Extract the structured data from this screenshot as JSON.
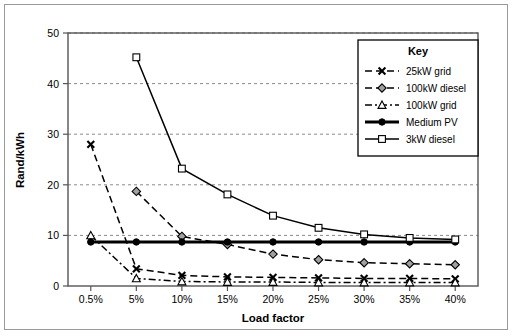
{
  "chart_data": {
    "type": "line",
    "title": "",
    "xlabel": "Load factor",
    "ylabel": "Rand/kWh",
    "categories": [
      "0.5%",
      "5%",
      "10%",
      "15%",
      "20%",
      "25%",
      "30%",
      "35%",
      "40%"
    ],
    "ylim": [
      0,
      50
    ],
    "yticks": [
      0,
      10,
      20,
      30,
      40,
      50
    ],
    "ytick_labels": [
      "0",
      "10",
      "20",
      "30",
      "40",
      "50"
    ],
    "grid": "horizontal-dashed",
    "legend_position": "upper-right-inside",
    "legend_title": "Key",
    "series": [
      {
        "name": "25kW grid",
        "marker": "x",
        "line": "dashed",
        "color": "#000000",
        "values": [
          28.0,
          3.4,
          2.1,
          1.8,
          1.7,
          1.6,
          1.5,
          1.5,
          1.4
        ]
      },
      {
        "name": "100kW diesel",
        "marker": "diamond-filled-gray",
        "line": "dashed",
        "color": "#000000",
        "marker_fill": "#a0a0a0",
        "values": [
          null,
          18.7,
          9.8,
          8.2,
          6.3,
          5.2,
          4.6,
          4.4,
          4.2
        ]
      },
      {
        "name": "100kW grid",
        "marker": "triangle-open",
        "line": "dash-dot",
        "color": "#000000",
        "marker_fill": "#ffffff",
        "values": [
          10.0,
          1.5,
          0.9,
          0.8,
          0.8,
          0.7,
          0.7,
          0.7,
          0.7
        ]
      },
      {
        "name": "Medium PV",
        "marker": "circle-filled",
        "line": "solid-thick",
        "color": "#000000",
        "marker_fill": "#000000",
        "values": [
          8.7,
          8.7,
          8.7,
          8.7,
          8.7,
          8.7,
          8.7,
          8.7,
          8.7
        ]
      },
      {
        "name": "3kW diesel",
        "marker": "square-open",
        "line": "solid",
        "color": "#000000",
        "marker_fill": "#ffffff",
        "values": [
          null,
          45.2,
          23.2,
          18.1,
          13.9,
          11.5,
          10.2,
          9.5,
          9.2
        ]
      }
    ]
  }
}
